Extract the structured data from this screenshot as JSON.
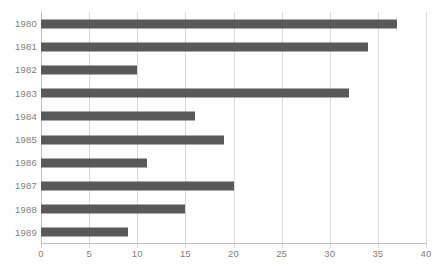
{
  "chart_data": {
    "type": "bar",
    "orientation": "horizontal",
    "title": "",
    "subtitle": "",
    "xlabel": "",
    "ylabel": "",
    "categories": [
      "1980",
      "1981",
      "1982",
      "1983",
      "1984",
      "1985",
      "1986",
      "1987",
      "1988",
      "1989"
    ],
    "values": [
      37,
      34,
      10,
      32,
      16,
      19,
      11,
      20,
      15,
      9
    ],
    "series": [
      {
        "name": "",
        "values": [
          37,
          34,
          10,
          32,
          16,
          19,
          11,
          20,
          15,
          9
        ]
      }
    ],
    "xlim": [
      0,
      40
    ],
    "xticks": [
      0,
      5,
      10,
      15,
      20,
      25,
      30,
      35,
      40
    ],
    "xtick_labels": [
      "0",
      "5",
      "10",
      "15",
      "20",
      "25",
      "30",
      "35",
      "40"
    ],
    "ytick_labels": [
      "1980",
      "1981",
      "1982",
      "1983",
      "1984",
      "1985",
      "1986",
      "1987",
      "1988",
      "1989"
    ],
    "grid": "vertical",
    "legend": "none",
    "bar_color": "#595959",
    "gridline_color": "#D9D9D9",
    "axis_color": "#BFBFBF",
    "tick_label_color": "#808080",
    "background_color": "#FFFFFF",
    "annotations": []
  }
}
